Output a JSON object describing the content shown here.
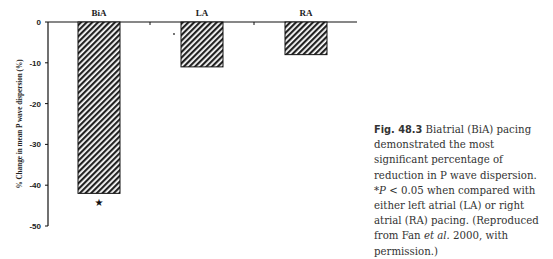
{
  "chart_data": {
    "type": "bar",
    "title": "",
    "categories": [
      "BiA",
      "LA",
      "RA"
    ],
    "values": [
      -42,
      -11,
      -8
    ],
    "xlabel": "",
    "ylabel": "% Change in mean P wave dispersion (%)",
    "ylim": [
      -50,
      0
    ],
    "yticks": [
      0,
      -10,
      -20,
      -30,
      -40,
      -50
    ],
    "grid": false,
    "legend": null,
    "annotations": [
      {
        "text": "★",
        "category": "BiA",
        "position": "below bar",
        "meaning": "*P < 0.05"
      }
    ],
    "bar_fill": "diagonal-hatch",
    "category_labels_position": "top"
  },
  "caption": {
    "label": "Fig. 48.3",
    "text": "Biatrial (BiA) pacing demonstrated the most significant percentage of reduction in P wave dispersion. *P < 0.05 when compared with either left atrial (LA) or right atrial (RA) pacing. (Reproduced from Fan et al. 2000, with permission.)",
    "part1": " Biatrial (BiA) pacing demonstrated the most significant percentage of reduction in P wave dispersion. *",
    "p_italic": "P",
    "part2": " < 0.05 when compared with either left atrial (LA) or right atrial (RA) pacing. (Reproduced from Fan ",
    "etal": "et al.",
    "part3": " 2000, with permission.)"
  }
}
